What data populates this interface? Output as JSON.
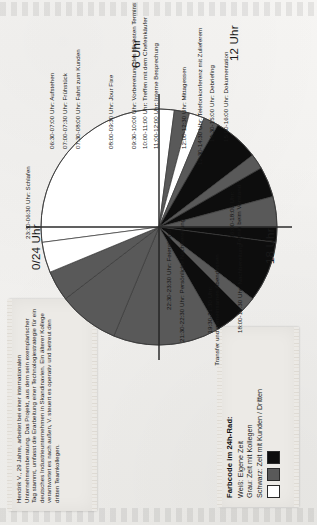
{
  "document": {
    "kind": "24h-Rad Tagesablauf Diagramm",
    "bio_card": {
      "text": "Hendrik V., 29 Jahre, arbeitet bei einer internationalen Unternehmensberatung. Das Projekt, aus dem sein exemplarischer Tag stammt, umfasst die Erarbeitung einer Technologiestrategie für ein deutsches Industrieunternehmen in Skandinavien. Ein älterer Kollege verantwortet es nach außen, V. steuert es operativ und betreut den dritten Teamkollegen."
    },
    "legend": {
      "title": "Farbcode im 24h-Rad:",
      "rows": [
        "Weiß: Eigene Zeit",
        "Grau: Zeit mit Kollegen",
        "Schwarz: Zeit mit Kunden / Dritten"
      ],
      "swatches": [
        {
          "name": "white-swatch",
          "color": "#ffffff",
          "meaning": "Eigene Zeit"
        },
        {
          "name": "gray-swatch",
          "color": "#595959",
          "meaning": "Zeit mit Kollegen"
        },
        {
          "name": "black-swatch",
          "color": "#0d0d0d",
          "meaning": "Zeit mit Kunden / Dritten"
        }
      ]
    },
    "hour_marks": [
      {
        "id": "h0",
        "label": "0/24 Uhr"
      },
      {
        "id": "h6",
        "label": "6 Uhr"
      },
      {
        "id": "h12",
        "label": "12 Uhr"
      },
      {
        "id": "h18",
        "label": "18 Uhr"
      }
    ]
  },
  "colors": {
    "white": "#ffffff",
    "gray": "#595959",
    "black": "#0d0d0d",
    "outline": "#3a3a3a",
    "axis": "#2b2b2b",
    "paper": "#eceae6",
    "page": "#f2f1ef"
  },
  "chart_data": {
    "type": "pie",
    "subtitle": "Farbcode im 24h-Rad",
    "total_hours": 24,
    "start_angle_hours": 0,
    "direction": "clockwise",
    "legend": [
      "Weiß: Eigene Zeit",
      "Grau: Zeit mit Kollegen",
      "Schwarz: Zeit mit Kunden / Dritten"
    ],
    "categories": [
      "23:30-06:30 Uhr: Schlafen",
      "06:30-07:00 Uhr: Aufstehen",
      "07:00-07:30 Uhr: Frühstück",
      "07:30-08:00 Uhr: Fahrt zum Kunden",
      "08:00-09:30 Uhr: Jour Fixe",
      "09:30-10:00 Uhr: Vorbereitung des nächsten Termins",
      "10:00-11:00 Uhr: Treffen mit dem Chefeinkäufer",
      "11:00-12:00 Uhr: Interne Besprechung",
      "12:00-12:30 Uhr: Mittagessen",
      "12:30-14:30 Uhr: Telefonkonferenz mit Zulieferern",
      "14:30-15:00 Uhr: Debriefing",
      "15:00-16:00 Uhr: Dokumentation",
      "16:00-18:00 Uhr: Termin beim Vorstand",
      "18:00-19:30 Uhr: Nachbereitung",
      "19:30-21:30 Uhr: Transfer und gemeinsames Abendessen",
      "21:30-22:30 Uhr: Persönliche Nachbereitung",
      "22:30-23:30 Uhr: Feierabend"
    ],
    "values": [
      7.0,
      0.5,
      0.5,
      0.5,
      1.5,
      0.5,
      1.0,
      1.0,
      0.5,
      2.0,
      0.5,
      1.0,
      2.0,
      1.5,
      2.0,
      1.0,
      1.0
    ],
    "xlabel": "",
    "ylabel": "Stunden",
    "grid": false,
    "legend_position": "external-left",
    "segments": [
      {
        "label": "23:30-06:30 Uhr: Schlafen",
        "start": 23.5,
        "end": 30.5,
        "hours": 7.0,
        "color": "#ffffff",
        "category": "Eigene Zeit"
      },
      {
        "label": "06:30-07:00 Uhr: Aufstehen",
        "start": 6.5,
        "end": 7.0,
        "hours": 0.5,
        "color": "#595959",
        "category": "Zeit mit Kollegen"
      },
      {
        "label": "07:00-07:30 Uhr: Frühstück",
        "start": 7.0,
        "end": 7.5,
        "hours": 0.5,
        "color": "#ffffff",
        "category": "Eigene Zeit"
      },
      {
        "label": "07:30-08:00 Uhr: Fahrt zum Kunden",
        "start": 7.5,
        "end": 8.0,
        "hours": 0.5,
        "color": "#595959",
        "category": "Zeit mit Kollegen"
      },
      {
        "label": "08:00-09:30 Uhr: Jour Fixe",
        "start": 8.0,
        "end": 9.5,
        "hours": 1.5,
        "color": "#0d0d0d",
        "category": "Zeit mit Kunden / Dritten"
      },
      {
        "label": "09:30-10:00 Uhr: Vorbereitung des nächsten Termins",
        "start": 9.5,
        "end": 10.0,
        "hours": 0.5,
        "color": "#595959",
        "category": "Zeit mit Kollegen"
      },
      {
        "label": "10:00-11:00 Uhr: Treffen mit dem Chefeinkäufer",
        "start": 10.0,
        "end": 11.0,
        "hours": 1.0,
        "color": "#0d0d0d",
        "category": "Zeit mit Kunden / Dritten"
      },
      {
        "label": "11:00-12:00 Uhr: Interne Besprechung",
        "start": 11.0,
        "end": 12.0,
        "hours": 1.0,
        "color": "#595959",
        "category": "Zeit mit Kollegen"
      },
      {
        "label": "12:00-12:30 Uhr: Mittagessen",
        "start": 12.0,
        "end": 12.5,
        "hours": 0.5,
        "color": "#0d0d0d",
        "category": "Zeit mit Kunden / Dritten"
      },
      {
        "label": "12:30-14:30 Uhr: Telefonkonferenz mit Zulieferern",
        "start": 12.5,
        "end": 14.5,
        "hours": 2.0,
        "color": "#0d0d0d",
        "category": "Zeit mit Kunden / Dritten"
      },
      {
        "label": "14:30-15:00 Uhr: Debriefing",
        "start": 14.5,
        "end": 15.0,
        "hours": 0.5,
        "color": "#595959",
        "category": "Zeit mit Kollegen"
      },
      {
        "label": "15:00-16:00 Uhr: Dokumentation",
        "start": 15.0,
        "end": 16.0,
        "hours": 1.0,
        "color": "#0d0d0d",
        "category": "Zeit mit Kunden / Dritten"
      },
      {
        "label": "16:00-18:00 Uhr: Termin beim Vorstand",
        "start": 16.0,
        "end": 18.0,
        "hours": 2.0,
        "color": "#595959",
        "category": "Zeit mit Kollegen"
      },
      {
        "label": "18:00-19:30 Uhr: Nachbereitung",
        "start": 18.0,
        "end": 19.5,
        "hours": 1.5,
        "color": "#595959",
        "category": "Zeit mit Kollegen"
      },
      {
        "label": "19:30-21:30 Uhr: Transfer und gemeinsames Abendessen",
        "start": 19.5,
        "end": 21.5,
        "hours": 2.0,
        "color": "#595959",
        "category": "Zeit mit Kollegen"
      },
      {
        "label": "21:30-22:30 Uhr: Persönliche Nachbereitung",
        "start": 21.5,
        "end": 22.5,
        "hours": 1.0,
        "color": "#595959",
        "category": "Zeit mit Kollegen"
      },
      {
        "label": "22:30-23:30 Uhr: Feierabend",
        "start": 22.5,
        "end": 23.5,
        "hours": 1.0,
        "color": "#ffffff",
        "category": "Eigene Zeit"
      }
    ]
  },
  "labels": {
    "schlafen": "23:30-06:30 Uhr: Schlafen",
    "aufstehen": "06:30-07:00 Uhr: Aufstehen",
    "fruehstueck": "07:00-07:30 Uhr: Frühstück",
    "fahrt": "07:30-08:00 Uhr: Fahrt zum Kunden",
    "jourfixe": "08:00-09:30 Uhr: Jour Fixe",
    "vorbereitung": "09:30-10:00 Uhr: Vorbereitung des nächsten Termins",
    "chefeinkaeufer": "10:00-11:00 Uhr: Treffen mit dem Chefeinkäufer",
    "besprechung": "11:00-12:00 Uhr: Interne Besprechung",
    "mittagessen": "12:00-12:30 Uhr: Mittagessen",
    "telko": "12:30-14:30 Uhr: Telefonkonferenz mit Zulieferern",
    "debriefing": "14:30-15:00 Uhr: Debriefing",
    "dokumentation": "15:00-16:00 Uhr: Dokumentation",
    "vorstand_line1": "16:00-18:00 Uhr:",
    "vorstand_line2": "Termin beim Vorstand",
    "nachbereitung": "18:00-19:30 Uhr: Nachbereitung",
    "abend_line1": "19:30-21:30 Uhr:",
    "abend_line2": "Transfer und gemeinsames Abendessen",
    "pers_nachbereitung": "21:30-22:30 Uhr: Persönliche Nachbereitung",
    "feierabend": "22:30-23:30 Uhr: Feierabend",
    "hour0": "0/24 Uhr",
    "hour6": "6 Uhr",
    "hour12": "12 Uhr",
    "hour18": "18 Uhr"
  }
}
